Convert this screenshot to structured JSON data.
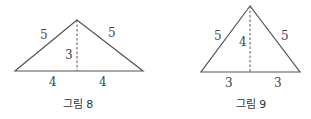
{
  "figures": [
    {
      "caption": "그림 8",
      "left_side": "5",
      "right_side": "5",
      "height": "3",
      "base_left": "4",
      "base_right": "4"
    },
    {
      "caption": "그림 9",
      "left_side": "5",
      "right_side": "5",
      "height": "4",
      "base_left": "3",
      "base_right": "3"
    }
  ],
  "colors": {
    "line": "#555555",
    "text": "#444444"
  }
}
